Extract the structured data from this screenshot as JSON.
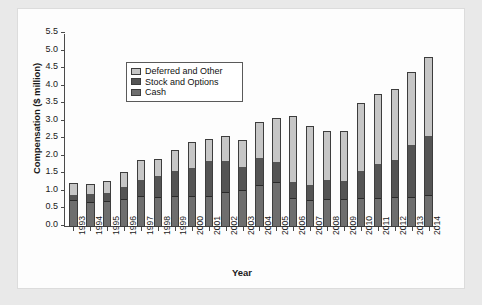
{
  "chart_data": {
    "type": "bar",
    "subtype": "stacked-vertical",
    "title": "",
    "xlabel": "Year",
    "ylabel": "Compensation ($ million)",
    "ylim": [
      0.0,
      5.5
    ],
    "ytick_labels": [
      "0.0",
      "0.5",
      "1.0",
      "1.5",
      "2.0",
      "2.5",
      "3.0",
      "3.5",
      "4.0",
      "4.5",
      "5.0",
      "5.5"
    ],
    "ytick_values": [
      0.0,
      0.5,
      1.0,
      1.5,
      2.0,
      2.5,
      3.0,
      3.5,
      4.0,
      4.5,
      5.0,
      5.5
    ],
    "grid": false,
    "legend_position": "upper-left-inside",
    "categories": [
      "1993",
      "1994",
      "1995",
      "1996",
      "1997",
      "1998",
      "1999",
      "2000",
      "2001",
      "2002",
      "2003",
      "2004",
      "2005",
      "2006",
      "2007",
      "2008",
      "2009",
      "2010",
      "2011",
      "2012",
      "2013",
      "2014"
    ],
    "series": [
      {
        "name": "Cash",
        "color": "#6e6e6e",
        "values": [
          0.75,
          0.71,
          0.74,
          0.78,
          0.86,
          0.84,
          0.86,
          0.87,
          0.85,
          0.97,
          1.02,
          1.17,
          1.26,
          0.78,
          0.74,
          0.76,
          0.76,
          0.79,
          0.78,
          0.81,
          0.82,
          0.87
        ]
      },
      {
        "name": "Stock and Options",
        "color": "#545454",
        "values": [
          0.17,
          0.23,
          0.24,
          0.38,
          0.49,
          0.63,
          0.74,
          0.82,
          1.04,
          0.92,
          0.7,
          0.79,
          0.6,
          0.49,
          0.44,
          0.57,
          0.54,
          0.8,
          0.99,
          1.09,
          1.5,
          1.72
        ]
      },
      {
        "name": "Deferred and Other",
        "color": "#c6c6c6",
        "values": [
          0.33,
          0.29,
          0.32,
          0.41,
          0.57,
          0.48,
          0.59,
          0.74,
          0.63,
          0.71,
          0.75,
          1.02,
          1.24,
          1.9,
          1.71,
          1.42,
          1.45,
          1.93,
          2.01,
          2.04,
          2.09,
          2.25
        ]
      }
    ],
    "totals": [
      1.25,
      1.23,
      1.3,
      1.57,
      1.92,
      1.95,
      2.19,
      2.43,
      2.52,
      2.6,
      2.47,
      2.98,
      3.1,
      3.17,
      2.89,
      2.75,
      2.75,
      3.52,
      3.78,
      3.94,
      4.41,
      4.84
    ]
  },
  "legend": {
    "items": [
      {
        "label": "Deferred and Other",
        "key": "deferred"
      },
      {
        "label": "Stock and Options",
        "key": "stock"
      },
      {
        "label": "Cash",
        "key": "cash"
      }
    ]
  },
  "colors": {
    "deferred": "#c6c6c6",
    "stock": "#545454",
    "cash": "#6e6e6e",
    "axis": "#4a4a4a",
    "panel_background": "#fdfdfd",
    "page_background": "#e9e9e9"
  }
}
